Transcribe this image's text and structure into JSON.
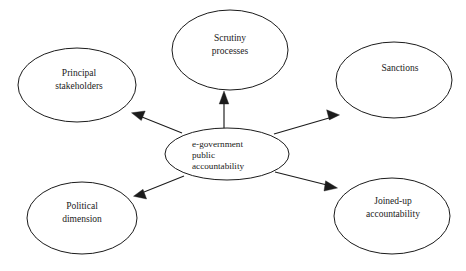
{
  "diagram": {
    "background_color": "#ffffff",
    "stroke_color": "#1b1b1b",
    "text_color": "#1a1a1a",
    "center_node": {
      "id": "center",
      "lines": [
        "e-government",
        "public",
        "accountability"
      ],
      "line1": "e-government",
      "line2": "public",
      "line3": "accountability",
      "text_align": "left",
      "cx": 227,
      "cy": 154,
      "rx": 62,
      "ry": 26
    },
    "nodes": [
      {
        "id": "scrutiny-processes",
        "line1": "Scrutiny",
        "line2": "processes",
        "cx": 230,
        "cy": 50,
        "rx": 58,
        "ry": 40,
        "position": "top"
      },
      {
        "id": "principal-stakeholders",
        "line1": "Principal",
        "line2": "stakeholders",
        "cx": 77,
        "cy": 85,
        "rx": 59,
        "ry": 37,
        "position": "upper-left"
      },
      {
        "id": "sanctions",
        "line1": "Sanctions",
        "line2": "",
        "cx": 394,
        "cy": 80,
        "rx": 58,
        "ry": 38,
        "position": "upper-right"
      },
      {
        "id": "political-dimension",
        "line1": "Political",
        "line2": "dimension",
        "cx": 82,
        "cy": 218,
        "rx": 55,
        "ry": 36,
        "position": "lower-left"
      },
      {
        "id": "joined-up-accountability",
        "line1": "Joined-up",
        "line2": "accountability",
        "cx": 392,
        "cy": 216,
        "rx": 58,
        "ry": 38,
        "position": "lower-right"
      }
    ],
    "edges": [
      {
        "id": "edge-center-to-scrutiny",
        "from": "center",
        "to": "scrutiny-processes",
        "direction": "outgoing",
        "arrow": "single"
      },
      {
        "id": "edge-center-to-principal-stakeholders",
        "from": "center",
        "to": "principal-stakeholders",
        "direction": "outgoing",
        "arrow": "single"
      },
      {
        "id": "edge-center-to-sanctions",
        "from": "center",
        "to": "sanctions",
        "direction": "outgoing",
        "arrow": "single"
      },
      {
        "id": "edge-center-to-political-dimension",
        "from": "center",
        "to": "political-dimension",
        "direction": "outgoing",
        "arrow": "single"
      },
      {
        "id": "edge-center-to-joined-up-accountability",
        "from": "center",
        "to": "joined-up-accountability",
        "direction": "outgoing",
        "arrow": "single"
      }
    ]
  }
}
